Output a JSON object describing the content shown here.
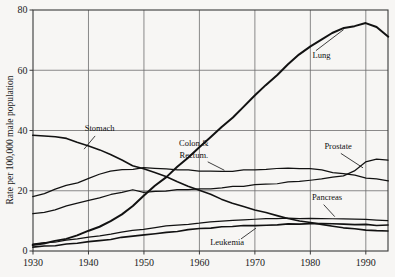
{
  "chart_data": {
    "type": "line",
    "title": "",
    "xlabel": "",
    "ylabel": "Rate per 100,000 male population",
    "xlim": [
      1930,
      1994
    ],
    "ylim": [
      0,
      80
    ],
    "grid": true,
    "legend_position": "inline-annotations",
    "xticks": [
      "1930",
      "1940",
      "1950",
      "1960",
      "1970",
      "1980",
      "1990"
    ],
    "xtick_values": [
      1930,
      1940,
      1950,
      1960,
      1970,
      1980,
      1990
    ],
    "yticks": [
      "0",
      "20",
      "40",
      "60",
      "80"
    ],
    "ytick_values": [
      0,
      20,
      40,
      60,
      80
    ],
    "x": [
      1930,
      1932,
      1934,
      1936,
      1938,
      1940,
      1942,
      1944,
      1946,
      1948,
      1950,
      1952,
      1954,
      1956,
      1958,
      1960,
      1962,
      1964,
      1966,
      1968,
      1970,
      1972,
      1974,
      1976,
      1978,
      1980,
      1982,
      1984,
      1986,
      1988,
      1990,
      1992,
      1994
    ],
    "series": [
      {
        "name": "Lung",
        "label": "Lung",
        "values": [
          2.0,
          2.6,
          3.3,
          4.2,
          5.2,
          6.6,
          8.2,
          10.0,
          12.2,
          15.0,
          18.3,
          21.6,
          24.6,
          27.8,
          31.0,
          34.4,
          37.6,
          41.0,
          44.4,
          48.0,
          51.5,
          55.0,
          58.5,
          62.0,
          65.2,
          68.0,
          70.2,
          72.4,
          74.0,
          74.8,
          75.8,
          74.2,
          71.2
        ]
      },
      {
        "name": "Stomach",
        "label": "Stomach",
        "values": [
          38.5,
          38.3,
          37.8,
          37.2,
          36.2,
          35.0,
          33.6,
          32.0,
          30.2,
          28.4,
          27.2,
          26.0,
          24.6,
          23.0,
          21.6,
          20.2,
          18.8,
          17.4,
          16.0,
          14.8,
          13.6,
          12.6,
          11.6,
          10.8,
          10.0,
          9.4,
          8.8,
          8.3,
          7.8,
          7.4,
          7.1,
          6.8,
          6.5
        ]
      },
      {
        "name": "Colon & Rectum",
        "label": "Colon &\nRectum.",
        "values": [
          18.2,
          19.2,
          20.4,
          21.6,
          22.8,
          24.2,
          25.4,
          26.4,
          27.0,
          27.3,
          27.5,
          27.4,
          27.2,
          27.0,
          26.8,
          26.7,
          26.6,
          26.5,
          26.6,
          26.8,
          27.0,
          27.2,
          27.4,
          27.5,
          27.4,
          27.2,
          26.8,
          26.2,
          25.6,
          25.0,
          24.4,
          23.8,
          23.3
        ]
      },
      {
        "name": "Prostate",
        "label": "Prostate",
        "values": [
          12.2,
          13.0,
          13.8,
          14.8,
          15.8,
          16.8,
          17.8,
          18.6,
          19.4,
          20.2,
          19.6,
          19.8,
          20.0,
          20.2,
          20.4,
          20.6,
          20.8,
          21.0,
          21.3,
          21.6,
          21.9,
          22.2,
          22.5,
          22.9,
          23.2,
          23.6,
          24.0,
          24.4,
          25.0,
          26.6,
          29.4,
          30.6,
          30.0
        ]
      },
      {
        "name": "Pancreas",
        "label": "Pancreas",
        "values": [
          2.2,
          2.6,
          3.0,
          3.5,
          4.0,
          4.6,
          5.1,
          5.7,
          6.2,
          6.8,
          7.3,
          7.8,
          8.2,
          8.6,
          9.0,
          9.3,
          9.6,
          9.9,
          10.1,
          10.3,
          10.5,
          10.6,
          10.7,
          10.8,
          10.8,
          10.8,
          10.7,
          10.6,
          10.5,
          10.4,
          10.3,
          10.2,
          10.1
        ]
      },
      {
        "name": "Leukemia",
        "label": "Leukemia",
        "values": [
          1.2,
          1.5,
          1.8,
          2.2,
          2.6,
          3.0,
          3.4,
          3.9,
          4.4,
          4.9,
          5.4,
          5.8,
          6.2,
          6.6,
          7.0,
          7.3,
          7.6,
          7.9,
          8.1,
          8.3,
          8.5,
          8.7,
          8.8,
          8.9,
          9.0,
          9.0,
          9.0,
          9.0,
          8.9,
          8.8,
          8.7,
          8.6,
          8.5
        ]
      }
    ],
    "annotations": [
      {
        "name": "lung",
        "text": "Lung",
        "x": 1982,
        "y": 64
      },
      {
        "name": "stomach",
        "text": "Stomach",
        "x": 1942,
        "y": 40
      },
      {
        "name": "colon-rectum-line1",
        "text": "Colon &",
        "x": 1959,
        "y": 35
      },
      {
        "name": "colon-rectum-line2",
        "text": "Rectum.",
        "x": 1959,
        "y": 31
      },
      {
        "name": "prostate",
        "text": "Prostate",
        "x": 1985,
        "y": 34
      },
      {
        "name": "pancreas",
        "text": "Pancreas",
        "x": 1983,
        "y": 17
      },
      {
        "name": "leukemia",
        "text": "Leukemia",
        "x": 1965,
        "y": 2
      }
    ],
    "colors": {
      "line": "#121212",
      "grid": "#6d6d6d",
      "axis": "#3a3a3a",
      "background": "#f7f6f4",
      "text": "#1b1b1b"
    }
  }
}
